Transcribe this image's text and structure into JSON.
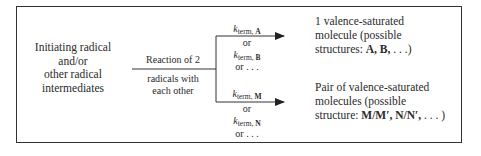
{
  "diagram": {
    "source_node": {
      "lines": [
        "Initiating radical",
        "and/or",
        "other radical",
        "intermediates"
      ]
    },
    "reaction_label": {
      "above": "Reaction of 2",
      "below_lines": [
        "radicals with",
        "each other"
      ]
    },
    "upper_branch": {
      "rate_labels": [
        {
          "k": "k",
          "sub_prefix": "term, ",
          "sub_species": "A"
        },
        {
          "k": "k",
          "sub_prefix": "term, ",
          "sub_species": "B"
        }
      ],
      "or_1": "or",
      "or_2": "or . . .",
      "product": {
        "line1": "1 valence-saturated",
        "line2": "molecule (possible",
        "line3_prefix": "structures: ",
        "line3_bold": "A, B,",
        "line3_suffix": " . . .)"
      }
    },
    "lower_branch": {
      "rate_labels": [
        {
          "k": "k",
          "sub_prefix": "term, ",
          "sub_species": "M"
        },
        {
          "k": "k",
          "sub_prefix": "term, ",
          "sub_species": "N"
        }
      ],
      "or_1": "or",
      "or_2": "or . . .",
      "product": {
        "line1": "Pair of valence-saturated",
        "line2": "molecules (possible",
        "line3_prefix": "structure: ",
        "line3_bold": "M/M′, N/N′,",
        "line3_suffix": " . . . )"
      }
    },
    "colors": {
      "line": "#333333",
      "text": "#2a2a2a",
      "background": "#ffffff"
    }
  }
}
